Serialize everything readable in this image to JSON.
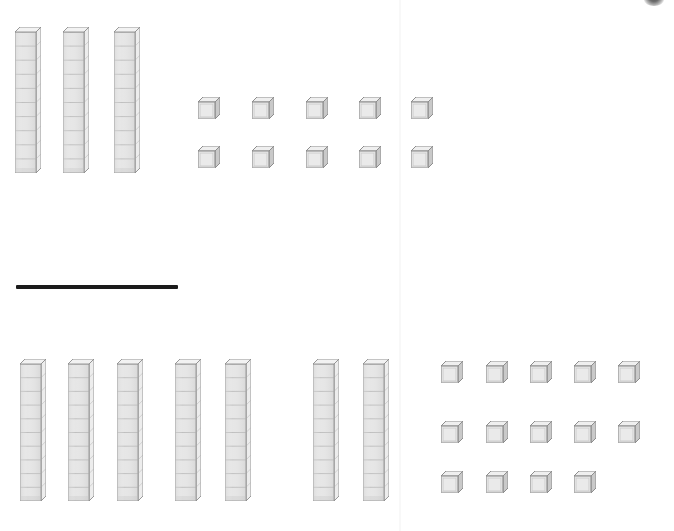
{
  "worksheet": {
    "title": "Base-Ten Blocks Addition",
    "width": 674,
    "height": 531,
    "background_color": "#ffffff"
  },
  "colors": {
    "block_fill": "#e2e2e2",
    "block_fill_light": "#ededed",
    "block_edge": "#8d8d8d",
    "block_shadow": "#b9b9b9",
    "block_inner_line": "#a8a8a8",
    "sum_bar": "#1b1b1b",
    "fold_line": "#000000"
  },
  "problem": {
    "operation": "addition",
    "top_addend": {
      "label": "Top addend",
      "rods": 3,
      "rod_segments": 10,
      "units": 10,
      "value": 40
    },
    "bottom_addend": {
      "label": "Bottom addend",
      "rods": 7,
      "rod_segments": 10,
      "units": 14,
      "value": 84
    },
    "sum_bar_label": "addition bar"
  },
  "top_section": {
    "name": "top-addend-blocks",
    "rods": [
      {
        "name": "rod-1",
        "x": 15,
        "y": 27,
        "w": 26,
        "h": 146
      },
      {
        "name": "rod-2",
        "x": 63,
        "y": 27,
        "w": 26,
        "h": 146
      },
      {
        "name": "rod-3",
        "x": 114,
        "y": 27,
        "w": 26,
        "h": 146
      }
    ],
    "unit_rows": [
      {
        "name": "top-unit-row-1",
        "y": 97,
        "xs": [
          198,
          252,
          306,
          359,
          411
        ]
      },
      {
        "name": "top-unit-row-2",
        "y": 146,
        "xs": [
          198,
          252,
          306,
          359,
          411
        ]
      }
    ]
  },
  "sum_bar": {
    "name": "sum-bar",
    "x": 16,
    "y": 285,
    "w": 162,
    "h": 4
  },
  "bottom_section": {
    "name": "bottom-addend-blocks",
    "rods": [
      {
        "name": "rod-1",
        "x": 20,
        "y": 359,
        "w": 26,
        "h": 142
      },
      {
        "name": "rod-2",
        "x": 68,
        "y": 359,
        "w": 26,
        "h": 142
      },
      {
        "name": "rod-3",
        "x": 117,
        "y": 359,
        "w": 26,
        "h": 142
      },
      {
        "name": "rod-4",
        "x": 175,
        "y": 359,
        "w": 26,
        "h": 142
      },
      {
        "name": "rod-5",
        "x": 225,
        "y": 359,
        "w": 26,
        "h": 142
      },
      {
        "name": "rod-6",
        "x": 313,
        "y": 359,
        "w": 26,
        "h": 142
      },
      {
        "name": "rod-7",
        "x": 363,
        "y": 359,
        "w": 26,
        "h": 142
      }
    ],
    "unit_rows": [
      {
        "name": "bottom-unit-row-1",
        "y": 361,
        "xs": [
          441,
          486,
          530,
          574,
          618
        ]
      },
      {
        "name": "bottom-unit-row-2",
        "y": 421,
        "xs": [
          441,
          486,
          530,
          574,
          618
        ]
      },
      {
        "name": "bottom-unit-row-3",
        "y": 471,
        "xs": [
          441,
          486,
          530,
          574
        ]
      }
    ]
  },
  "artifacts": {
    "fold_line": {
      "name": "page-fold-line",
      "x": 399
    },
    "top_smudge": {
      "name": "cropped-edge-mark",
      "x": 644,
      "y": -6,
      "w": 20,
      "h": 12
    }
  }
}
